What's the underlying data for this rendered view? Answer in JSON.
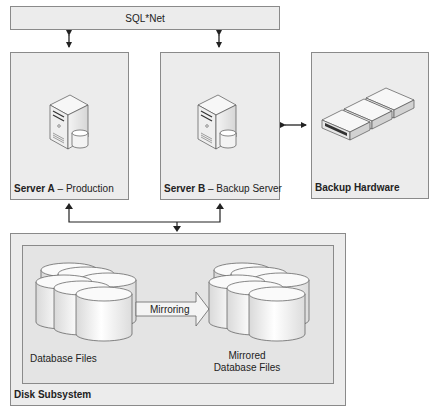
{
  "network": {
    "label": "SQL*Net"
  },
  "server_a": {
    "name": "Server A",
    "separator": " – ",
    "role": "Production",
    "icon": "server-with-database-icon"
  },
  "server_b": {
    "name": "Server B",
    "separator": "– ",
    "role": "Backup Server",
    "icon": "server-with-database-icon"
  },
  "backup_hardware": {
    "name": "Backup Hardware",
    "icon": "tape-drives-icon"
  },
  "disk_subsystem": {
    "name": "Disk Subsystem",
    "source": {
      "label": "Database Files",
      "icon": "disk-cylinders-icon"
    },
    "mirror_arrow": {
      "label": "Mirroring"
    },
    "target": {
      "label_line1": "Mirrored",
      "label_line2": "Database Files",
      "icon": "disk-cylinders-icon"
    }
  },
  "colors": {
    "box_fill": "#ececec",
    "box_border": "#8a8a8a",
    "inner_fill": "#e4e4e4",
    "arrow": "#222222"
  }
}
